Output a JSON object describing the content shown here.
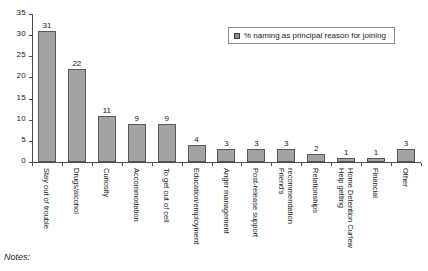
{
  "chart_data": {
    "type": "bar",
    "title": "",
    "xlabel": "",
    "ylabel": "",
    "ylim": [
      0,
      35
    ],
    "yticks": [
      0,
      5,
      10,
      15,
      20,
      25,
      30,
      35
    ],
    "grid": false,
    "legend_position": "top-right",
    "legend": [
      "% naming as principal reason for joining"
    ],
    "categories": [
      "Stay out of trouble",
      "Drugs/alcohol",
      "Curiosity",
      "Accommodation",
      "To get out of cell",
      "Education/employment",
      "Anger management",
      "Post-release support",
      "Friend's recommendation",
      "Relationships",
      "Help getting Home Detention Curfew",
      "Financial",
      "Other"
    ],
    "values": [
      31,
      22,
      11,
      9,
      9,
      4,
      3,
      3,
      3,
      2,
      1,
      1,
      3
    ],
    "series": [
      {
        "name": "% naming as principal reason for joining",
        "values": [
          31,
          22,
          11,
          9,
          9,
          4,
          3,
          3,
          3,
          2,
          1,
          1,
          3
        ]
      }
    ]
  },
  "chart": {
    "bar_color": "#a3a3a3",
    "bar_border_color": "#585858",
    "axis_color": "#4a4a4a",
    "category_labels": [
      {
        "line1": "Stay out of trouble",
        "line2": ""
      },
      {
        "line1": "Drugs/alcohol",
        "line2": ""
      },
      {
        "line1": "Curiosity",
        "line2": ""
      },
      {
        "line1": "Accommodation",
        "line2": ""
      },
      {
        "line1": "To get out of cell",
        "line2": ""
      },
      {
        "line1": "Education/employment",
        "line2": ""
      },
      {
        "line1": "Anger management",
        "line2": ""
      },
      {
        "line1": "Post-release support",
        "line2": ""
      },
      {
        "line1": "Friend's",
        "line2": "recommendation"
      },
      {
        "line1": "Relationships",
        "line2": ""
      },
      {
        "line1": "Help getting",
        "line2": "Home Detention Curfew"
      },
      {
        "line1": "Financial",
        "line2": ""
      },
      {
        "line1": "Other",
        "line2": ""
      }
    ],
    "value_labels": [
      "31",
      "22",
      "11",
      "9",
      "9",
      "4",
      "3",
      "3",
      "3",
      "2",
      "1",
      "1",
      "3"
    ],
    "ytick_labels": [
      "0",
      "5",
      "10",
      "15",
      "20",
      "25",
      "30",
      "35"
    ]
  },
  "legend": {
    "label": "% naming as principal reason for joining"
  },
  "footer": {
    "notes_label": "Notes:"
  }
}
